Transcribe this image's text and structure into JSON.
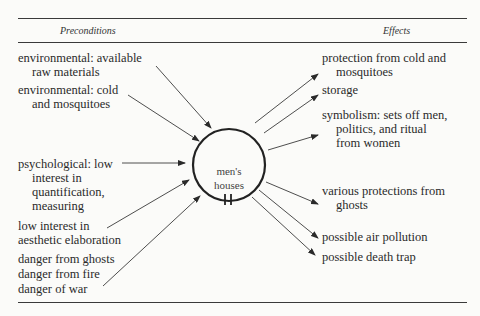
{
  "header": {
    "preconditions": "Preconditions",
    "effects": "Effects"
  },
  "center": {
    "line1": "men's",
    "line2": "houses"
  },
  "preconditions": [
    {
      "line1": "environmental: available",
      "line2": "raw materials"
    },
    {
      "line1": "environmental: cold",
      "line2": "and mosquitoes"
    },
    {
      "line1": "psychological: low",
      "line2": "interest in",
      "line3": "quantification,",
      "line4": "measuring"
    },
    {
      "line1": "low interest in",
      "line2": "aesthetic elaboration"
    },
    {
      "line1": "danger from ghosts",
      "line2": "danger from fire",
      "line3": "danger of war"
    }
  ],
  "effects": [
    {
      "line1": "protection from cold and",
      "line2": "mosquitoes"
    },
    {
      "line1": "storage"
    },
    {
      "line1": "symbolism: sets off men,",
      "line2": "politics, and ritual",
      "line3": "from women"
    },
    {
      "line1": "various protections from",
      "line2": "ghosts"
    },
    {
      "line1": "possible air pollution"
    },
    {
      "line1": "possible death trap"
    }
  ]
}
